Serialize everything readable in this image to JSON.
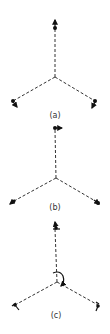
{
  "figure": {
    "panels": [
      {
        "label": "(a)",
        "mode": "symmetric stretch"
      },
      {
        "label": "(b)",
        "mode": "in-plane displacement"
      },
      {
        "label": "(c)",
        "mode": "rotational / bending"
      }
    ]
  }
}
